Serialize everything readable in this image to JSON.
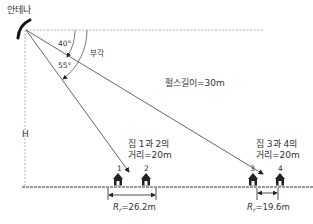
{
  "antenna": {
    "label": "안테나"
  },
  "angles": {
    "angle1": "40°",
    "angle2": "55°",
    "depression_label": "부각"
  },
  "height_label": "H",
  "pulse_length": "펄스길이=30m",
  "houses_1_2": {
    "line1": "집 1과 2의",
    "line2": "거리=20m",
    "numbers": [
      "1",
      "2"
    ],
    "range_symbol": "R",
    "range_sub": "r",
    "range_value": "=26.2m"
  },
  "houses_3_4": {
    "line1": "집 3과 4의",
    "line2": "거리=20m",
    "numbers": [
      "3",
      "4"
    ],
    "range_symbol": "R",
    "range_sub": "r",
    "range_value": "=19.6m"
  },
  "colors": {
    "line": "#444444",
    "dashed": "#888888",
    "house": "#222222",
    "ground": "#777777"
  }
}
